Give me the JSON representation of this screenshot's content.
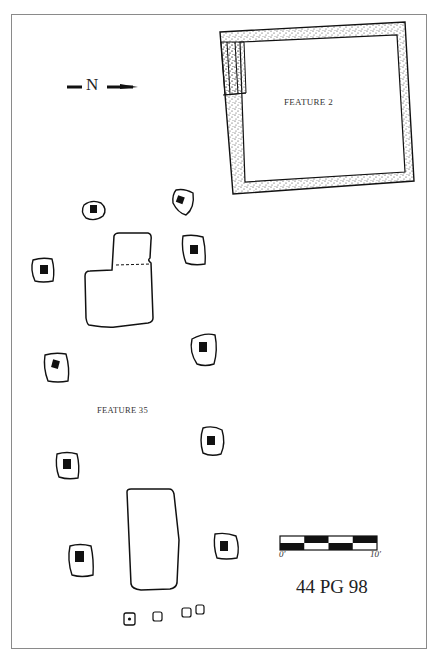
{
  "figure": {
    "north_arrow": {
      "label": "N",
      "direction": "right",
      "icon": "north-arrow-icon"
    },
    "features": [
      {
        "id": "feature-2",
        "label": "FEATURE 2",
        "type": "stippled-rectangular-structure"
      },
      {
        "id": "feature-35",
        "label": "FEATURE 35",
        "type": "post-hole-ring-with-central-pits"
      }
    ],
    "scale_bar": {
      "start_label": "0′",
      "end_label": "10′",
      "segments": 5
    },
    "site_number": "44 PG 98",
    "colors": {
      "ink": "#111111",
      "stipple": "#333333",
      "frame": "#8a8a8a",
      "background": "#ffffff"
    }
  }
}
